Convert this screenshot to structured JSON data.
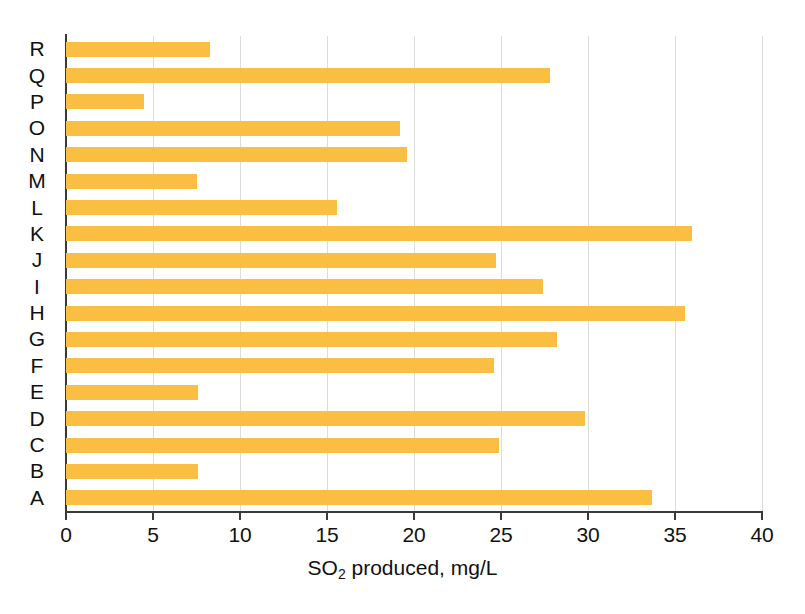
{
  "chart_data": {
    "type": "bar",
    "orientation": "horizontal",
    "title": "",
    "xlabel": "SO2 produced, mg/L",
    "xlabel_parts": {
      "pre": "SO",
      "sub": "2",
      "post": " produced, mg/L"
    },
    "ylabel": "",
    "xlim": [
      0,
      40
    ],
    "xticks": [
      0,
      5,
      10,
      15,
      20,
      25,
      30,
      35,
      40
    ],
    "xtick_labels": [
      "0",
      "5",
      "10",
      "15",
      "20",
      "25",
      "30",
      "35",
      "40"
    ],
    "grid": "vertical",
    "legend": "none",
    "bar_color": "#fabe42",
    "axis_color": "#3a3a3a",
    "gridline_color": "#dcdcdc",
    "categories": [
      "R",
      "Q",
      "P",
      "O",
      "N",
      "M",
      "L",
      "K",
      "J",
      "I",
      "H",
      "G",
      "F",
      "E",
      "D",
      "C",
      "B",
      "A"
    ],
    "values": [
      8.3,
      27.8,
      4.5,
      19.2,
      19.6,
      7.5,
      15.6,
      36.0,
      24.7,
      27.4,
      35.6,
      28.2,
      24.6,
      7.6,
      29.8,
      24.9,
      7.6,
      33.7
    ],
    "points": [
      {
        "category": "R",
        "value": 8.3
      },
      {
        "category": "Q",
        "value": 27.8
      },
      {
        "category": "P",
        "value": 4.5
      },
      {
        "category": "O",
        "value": 19.2
      },
      {
        "category": "N",
        "value": 19.6
      },
      {
        "category": "M",
        "value": 7.5
      },
      {
        "category": "L",
        "value": 15.6
      },
      {
        "category": "K",
        "value": 36.0
      },
      {
        "category": "J",
        "value": 24.7
      },
      {
        "category": "I",
        "value": 27.4
      },
      {
        "category": "H",
        "value": 35.6
      },
      {
        "category": "G",
        "value": 28.2
      },
      {
        "category": "F",
        "value": 24.6
      },
      {
        "category": "E",
        "value": 7.6
      },
      {
        "category": "D",
        "value": 29.8
      },
      {
        "category": "C",
        "value": 24.9
      },
      {
        "category": "B",
        "value": 7.6
      },
      {
        "category": "A",
        "value": 33.7
      }
    ]
  }
}
